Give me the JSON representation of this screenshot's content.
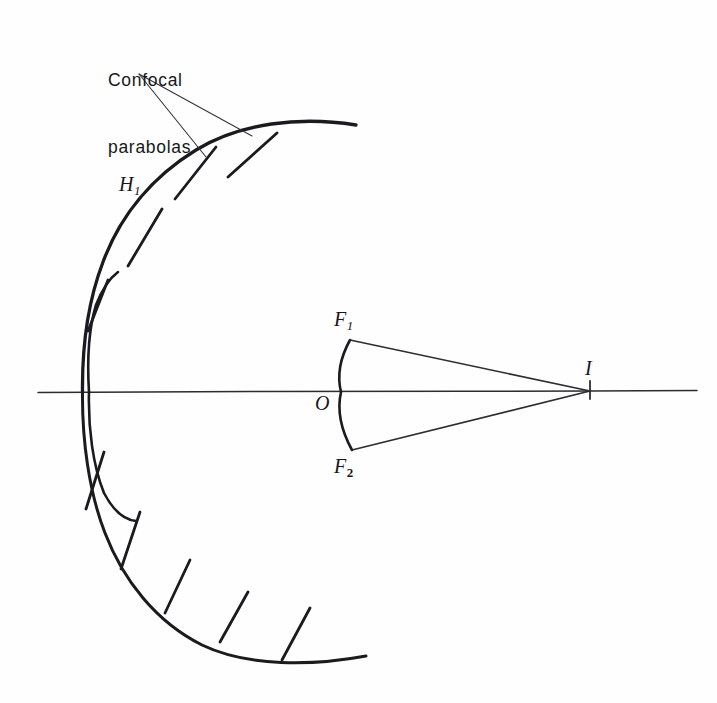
{
  "figure": {
    "background_color": "#fefefe",
    "ink_color": "#17171a",
    "width": 717,
    "height": 703
  },
  "labels": {
    "caption_line1": "Confocal",
    "caption_line2": "parabolas",
    "h1_letter": "H",
    "h1_subscript": "1",
    "f1_letter": "F",
    "f1_subscript": "1",
    "f2_letter": "F",
    "f2_subscript": "2",
    "origin": "O",
    "image_point": "I"
  },
  "geometry": {
    "optical_axis": {
      "x_start": 38,
      "x_end": 697,
      "y": 391
    },
    "big_parabola": {
      "vertex": {
        "x": 82,
        "y": 391
      },
      "upper_end": {
        "x": 356,
        "y": 125
      },
      "lower_end": {
        "x": 366,
        "y": 656
      }
    },
    "inner_parabola": {
      "vertex": {
        "x": 90,
        "y": 391
      },
      "upper_end": {
        "x": 118,
        "y": 272
      },
      "lower_end": {
        "x": 136,
        "y": 519
      }
    },
    "small_arc": {
      "vertex": {
        "x": 341,
        "y": 391
      },
      "top": {
        "x": 350,
        "y": 340
      },
      "bottom": {
        "x": 352,
        "y": 450
      }
    },
    "image_point": {
      "x": 590,
      "y": 391
    },
    "focus_1": {
      "x": 350,
      "y": 340
    },
    "focus_2": {
      "x": 352,
      "y": 450
    },
    "upper_tick_count": 4,
    "lower_tick_count": 5,
    "leader_origin": {
      "x": 139,
      "y": 74
    },
    "leader_target_a": {
      "x": 252,
      "y": 136
    },
    "leader_target_b": {
      "x": 206,
      "y": 157
    }
  }
}
